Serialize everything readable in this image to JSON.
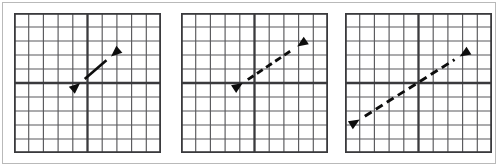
{
  "figure": {
    "background_color": "#ffffff",
    "frame_color": "#b9b9b9",
    "panel_count": 3
  },
  "grid": {
    "columns": 10,
    "rows": 10,
    "minor_line_color": "#59595c",
    "axis_line_color": "#3a3a3d",
    "border_color": "#3a3a3d",
    "x_axis_row_index": 5,
    "y_axis_column_index": 5,
    "x_range": [
      -5,
      5
    ],
    "y_range": [
      -5,
      5
    ]
  },
  "chart_data": {
    "type": "scatter",
    "xlabel": "",
    "ylabel": "",
    "xlim": [
      -5,
      5
    ],
    "ylim": [
      -5,
      5
    ],
    "grid": true,
    "legend": "none",
    "panels": [
      {
        "name": "panel-a",
        "label": "",
        "arrow": {
          "style": "solid",
          "heads": "both",
          "start": [
            -0.5,
            0.0
          ],
          "end": [
            1.6,
            1.9
          ],
          "length_cells": 2.8,
          "stroke_width": 2.6,
          "color": "#0d0d0d"
        }
      },
      {
        "name": "panel-b",
        "label": "",
        "arrow": {
          "style": "dashed",
          "heads": "both",
          "start": [
            -0.8,
            0.0
          ],
          "end": [
            2.9,
            2.6
          ],
          "length_cells": 5.0,
          "stroke_width": 2.8,
          "dash_pattern": "7,4",
          "color": "#0d0d0d"
        }
      },
      {
        "name": "panel-c",
        "label": "",
        "arrow": {
          "style": "dashed",
          "heads": "both",
          "start": [
            -4.0,
            -2.6
          ],
          "end": [
            2.8,
            1.9
          ],
          "length_cells": 8.2,
          "stroke_width": 2.9,
          "dash_pattern": "8,5",
          "color": "#0d0d0d"
        }
      }
    ]
  }
}
